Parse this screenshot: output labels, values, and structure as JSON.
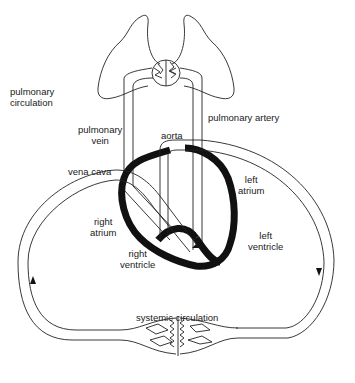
{
  "diagram": {
    "labels": {
      "pulmonary_circulation_line1": "pulmonary",
      "pulmonary_circulation_line2": "circulation",
      "pulmonary_vein_line1": "pulmonary",
      "pulmonary_vein_line2": "vein",
      "aorta": "aorta",
      "pulmonary_artery": "pulmonary artery",
      "vena_cava": "vena cava",
      "left_atrium_line1": "left",
      "left_atrium_line2": "atrium",
      "right_atrium_line1": "right",
      "right_atrium_line2": "atrium",
      "left_ventricle_line1": "left",
      "left_ventricle_line2": "ventricle",
      "right_ventricle_line1": "right",
      "right_ventricle_line2": "ventricle",
      "systemic_circulation": "systemic circulation"
    },
    "components": [
      "lungs",
      "lung capillary bed",
      "heart",
      "pulmonary artery",
      "pulmonary vein",
      "aorta",
      "vena cava",
      "systemic capillary bed"
    ],
    "flow_arrows": [
      "right side downward (aorta to body)",
      "left side upward (body to vena cava)"
    ],
    "colors": {
      "line": "#222222",
      "heart_wall": "#111111",
      "background": "#ffffff"
    }
  }
}
